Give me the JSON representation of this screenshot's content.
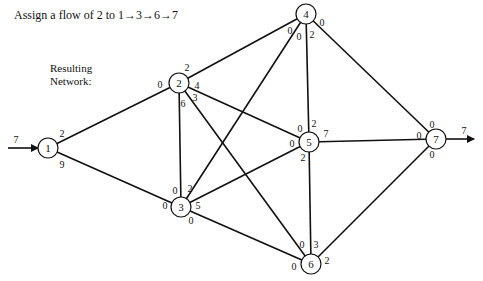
{
  "title": "Assign a flow of 2 to 1→3→6→7",
  "subtitle_line1": "Resulting",
  "subtitle_line2": "Network:",
  "source_flow": "7",
  "sink_flow": "7",
  "nodes": [
    {
      "id": "1",
      "x": 48,
      "y": 148
    },
    {
      "id": "2",
      "x": 179,
      "y": 83
    },
    {
      "id": "3",
      "x": 181,
      "y": 207
    },
    {
      "id": "4",
      "x": 306,
      "y": 14
    },
    {
      "id": "5",
      "x": 309,
      "y": 142
    },
    {
      "id": "6",
      "x": 311,
      "y": 264
    },
    {
      "id": "7",
      "x": 436,
      "y": 139
    }
  ],
  "edges": [
    {
      "from": "1",
      "to": "2",
      "cap_from": "2",
      "cap_to": "0"
    },
    {
      "from": "1",
      "to": "3",
      "cap_from": "9",
      "cap_to": "0"
    },
    {
      "from": "2",
      "to": "4",
      "cap_from": "2",
      "cap_to": "0"
    },
    {
      "from": "2",
      "to": "5",
      "cap_from": "4",
      "cap_to": "0"
    },
    {
      "from": "2",
      "to": "6",
      "cap_from": "3",
      "cap_to": "0"
    },
    {
      "from": "2",
      "to": "3",
      "cap_from": "6",
      "cap_to": "0"
    },
    {
      "from": "3",
      "to": "4",
      "cap_from": "2",
      "cap_to": "0"
    },
    {
      "from": "3",
      "to": "5",
      "cap_from": "5",
      "cap_to": "0"
    },
    {
      "from": "3",
      "to": "6",
      "cap_from": "0",
      "cap_to": "0"
    },
    {
      "from": "4",
      "to": "5",
      "cap_from": "2",
      "cap_to": "2"
    },
    {
      "from": "4",
      "to": "7",
      "cap_from": "0",
      "cap_to": "0"
    },
    {
      "from": "5",
      "to": "7",
      "cap_from": "7",
      "cap_to": "0"
    },
    {
      "from": "5",
      "to": "6",
      "cap_from": "2",
      "cap_to": "3"
    },
    {
      "from": "6",
      "to": "7",
      "cap_from": "2",
      "cap_to": "0"
    }
  ],
  "labels": [
    {
      "text": "2",
      "x": 62,
      "y": 133
    },
    {
      "text": "9",
      "x": 62,
      "y": 164
    },
    {
      "text": "0",
      "x": 160,
      "y": 84
    },
    {
      "text": "2",
      "x": 187,
      "y": 67
    },
    {
      "text": "4",
      "x": 197,
      "y": 85
    },
    {
      "text": "3",
      "x": 195,
      "y": 97
    },
    {
      "text": "6",
      "x": 183,
      "y": 103
    },
    {
      "text": "0",
      "x": 290,
      "y": 30
    },
    {
      "text": "0",
      "x": 299,
      "y": 36
    },
    {
      "text": "2",
      "x": 312,
      "y": 34
    },
    {
      "text": "0",
      "x": 322,
      "y": 22
    },
    {
      "text": "2",
      "x": 314,
      "y": 123
    },
    {
      "text": "0",
      "x": 300,
      "y": 128
    },
    {
      "text": "0",
      "x": 292,
      "y": 143
    },
    {
      "text": "7",
      "x": 326,
      "y": 133
    },
    {
      "text": "2",
      "x": 303,
      "y": 157
    },
    {
      "text": "0",
      "x": 419,
      "y": 135
    },
    {
      "text": "0",
      "x": 432,
      "y": 124
    },
    {
      "text": "0",
      "x": 432,
      "y": 154
    },
    {
      "text": "0",
      "x": 165,
      "y": 205
    },
    {
      "text": "0",
      "x": 175,
      "y": 190
    },
    {
      "text": "2",
      "x": 190,
      "y": 188
    },
    {
      "text": "5",
      "x": 198,
      "y": 205
    },
    {
      "text": "0",
      "x": 191,
      "y": 220
    },
    {
      "text": "0",
      "x": 302,
      "y": 244
    },
    {
      "text": "3",
      "x": 316,
      "y": 244
    },
    {
      "text": "0",
      "x": 294,
      "y": 266
    },
    {
      "text": "2",
      "x": 327,
      "y": 260
    }
  ]
}
